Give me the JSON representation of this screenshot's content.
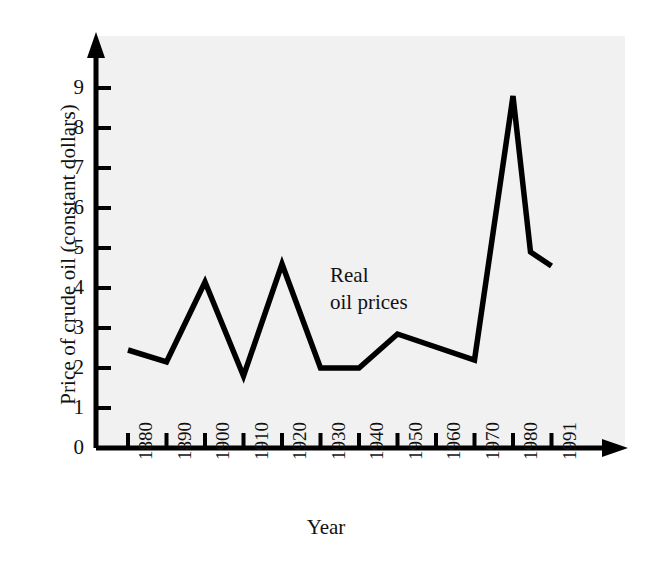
{
  "chart_data": {
    "type": "line",
    "title": "",
    "xlabel": "Year",
    "ylabel": "Price of crude oil (constant dollars)",
    "series_name": "Real oil prices",
    "annotation_lines": [
      "Real",
      "oil prices"
    ],
    "x": [
      1880,
      1890,
      1900,
      1910,
      1920,
      1930,
      1940,
      1950,
      1970,
      1980,
      1985,
      1991
    ],
    "values": [
      2.45,
      2.15,
      4.15,
      1.8,
      4.6,
      2.0,
      2.0,
      2.85,
      2.2,
      8.8,
      4.9,
      4.55
    ],
    "xtick_labels": [
      "1880",
      "1890",
      "1900",
      "1910",
      "1920",
      "1930",
      "1940",
      "1950",
      "1960",
      "1970",
      "1980",
      "1991"
    ],
    "xtick_years": [
      1880,
      1890,
      1900,
      1910,
      1920,
      1930,
      1940,
      1950,
      1960,
      1970,
      1980,
      1991
    ],
    "ytick_labels": [
      "0",
      "1",
      "2",
      "3",
      "4",
      "5",
      "6",
      "7",
      "8",
      "9"
    ],
    "ytick_values": [
      0,
      1,
      2,
      3,
      4,
      5,
      6,
      7,
      8,
      9
    ],
    "ylim": [
      0,
      9.8
    ],
    "grid": false,
    "legend": "none",
    "line_color": "#000000",
    "plot_background": "#f1f1f1",
    "page_background": "#ffffff"
  }
}
